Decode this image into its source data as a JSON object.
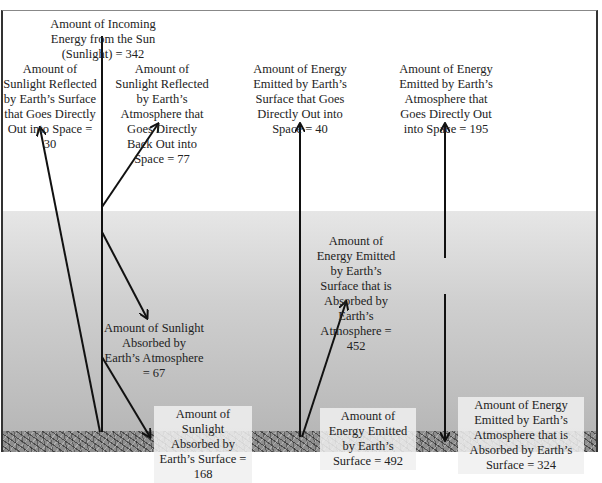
{
  "diagram": {
    "type": "energy-flow",
    "labels": {
      "incoming": "Amount of Incoming Energy from the Sun (Sunlight) = 342",
      "reflected_surface": "Amount of Sunlight Reflected by Earth’s Surface that Goes Directly Out into Space = 30",
      "reflected_atmosphere": "Amount of Sunlight Reflected by Earth’s Atmosphere that Goes Directly Back Out into Space = 77",
      "surface_to_space": "Amount of Energy Emitted by Earth’s Surface that Goes Directly Out into Space = 40",
      "atmosphere_to_space": "Amount of Energy Emitted by Earth’s Atmosphere that Goes Directly Out into Space = 195",
      "absorbed_atmosphere": "Amount of Sunlight Absorbed by Earth’s Atmosphere = 67",
      "surface_absorbed_by_atmosphere": "Amount of Energy Emitted by Earth’s Surface that is Absorbed by Earth’s Atmosphere = 452",
      "absorbed_surface": "Amount of Sunlight Absorbed by Earth’s Surface = 168",
      "surface_emitted": "Amount of Energy Emitted by Earth’s Surface = 492",
      "atmosphere_to_surface": "Amount of Energy Emitted by Earth’s Atmosphere that is Absorbed by Earth’s Surface = 324"
    },
    "values": {
      "incoming": 342,
      "reflected_surface": 30,
      "reflected_atmosphere": 77,
      "surface_to_space": 40,
      "atmosphere_to_space": 195,
      "absorbed_atmosphere": 67,
      "surface_absorbed_by_atmosphere": 452,
      "absorbed_surface": 168,
      "surface_emitted": 492,
      "atmosphere_to_surface": 324
    },
    "colors": {
      "arrow": "#111111",
      "sky": "#ffffff",
      "atmosphere_top": "#e6e6e6",
      "atmosphere_bottom": "#b5b5b5",
      "ground": "#8e8e8e"
    }
  }
}
